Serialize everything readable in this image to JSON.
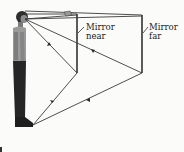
{
  "diagram": {
    "labels": {
      "mirror_near": [
        "Mirror",
        "near"
      ],
      "mirror_far": [
        "Mirror",
        "far"
      ]
    },
    "colors": {
      "line": "#3a3a3a",
      "figure": "#2a2a2a",
      "background": "#fbfbf9"
    }
  }
}
